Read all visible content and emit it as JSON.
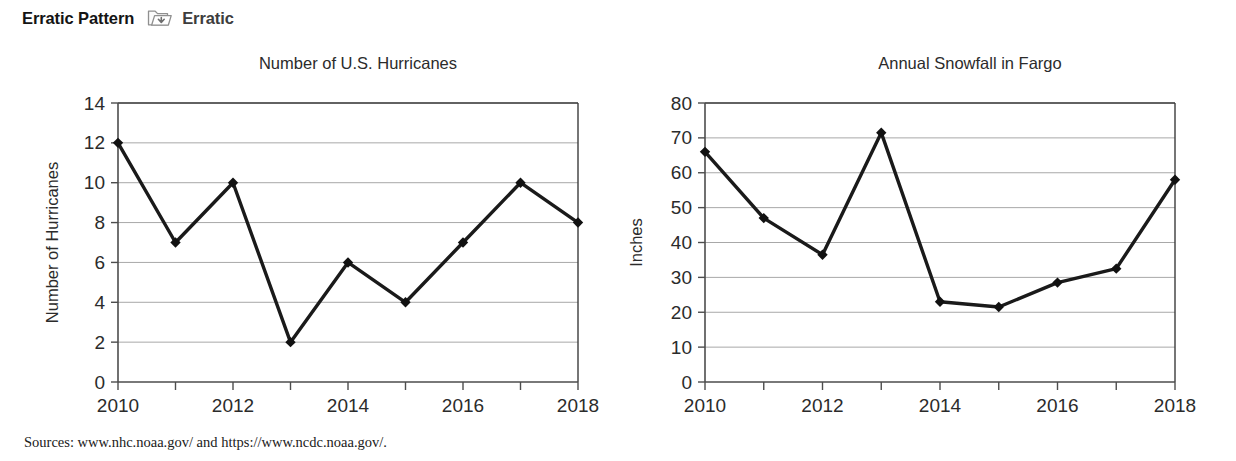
{
  "header": {
    "title": "Erratic Pattern",
    "icon": "folder-arrow-icon",
    "subtitle": "Erratic"
  },
  "source_note": "Sources: www.nhc.noaa.gov/ and https://www.ncdc.noaa.gov/.",
  "colors": {
    "line": "#1a1a1a",
    "marker": "#111111",
    "grid": "#a8a8a8",
    "axis": "#4d4d4d",
    "frame": "#3c3c3c",
    "text": "#2b2b2b"
  },
  "chart_data": [
    {
      "id": "hurricanes",
      "type": "line",
      "title": "Number of U.S. Hurricanes",
      "xlabel": "",
      "ylabel": "Number of Hurricanes",
      "x": [
        2010,
        2011,
        2012,
        2013,
        2014,
        2015,
        2016,
        2017,
        2018
      ],
      "values": [
        12,
        7,
        10,
        2,
        6,
        4,
        7,
        10,
        8
      ],
      "xticks": [
        2010,
        2011,
        2012,
        2013,
        2014,
        2015,
        2016,
        2017,
        2018
      ],
      "xtick_labels": [
        "2010",
        "",
        "2012",
        "",
        "2014",
        "",
        "2016",
        "",
        "2018"
      ],
      "yticks": [
        0,
        2,
        4,
        6,
        8,
        10,
        12,
        14
      ],
      "ytick_labels": [
        "0",
        "2",
        "4",
        "6",
        "8",
        "10",
        "12",
        "14"
      ],
      "xlim": [
        2010,
        2018
      ],
      "ylim": [
        0,
        14
      ],
      "grid": true,
      "legend": "none",
      "marker": "diamond"
    },
    {
      "id": "snowfall",
      "type": "line",
      "title": "Annual Snowfall in Fargo",
      "xlabel": "",
      "ylabel": "Inches",
      "x": [
        2010,
        2011,
        2012,
        2013,
        2014,
        2015,
        2016,
        2017,
        2018
      ],
      "values": [
        66,
        47,
        36.5,
        71.5,
        23,
        21.5,
        28.5,
        32.5,
        58
      ],
      "xticks": [
        2010,
        2011,
        2012,
        2013,
        2014,
        2015,
        2016,
        2017,
        2018
      ],
      "xtick_labels": [
        "2010",
        "",
        "2012",
        "",
        "2014",
        "",
        "2016",
        "",
        "2018"
      ],
      "yticks": [
        0,
        10,
        20,
        30,
        40,
        50,
        60,
        70,
        80
      ],
      "ytick_labels": [
        "0",
        "10",
        "20",
        "30",
        "40",
        "50",
        "60",
        "70",
        "80"
      ],
      "xlim": [
        2010,
        2018
      ],
      "ylim": [
        0,
        80
      ],
      "grid": true,
      "legend": "none",
      "marker": "diamond"
    }
  ]
}
